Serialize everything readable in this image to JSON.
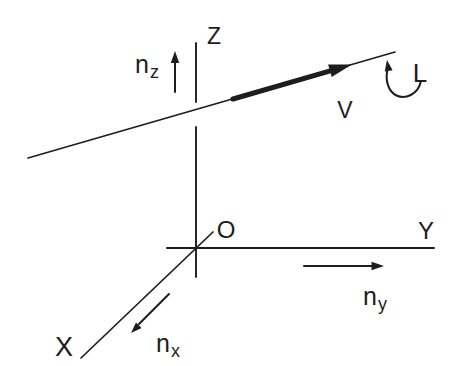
{
  "figure": {
    "colors": {
      "ink": "#1d1d1d",
      "background": "#ffffff"
    },
    "labels": {
      "z_axis": "Z",
      "y_axis": "Y",
      "x_axis": "X",
      "origin": "O",
      "line": "L",
      "vector": "V",
      "n_x": {
        "base": "n",
        "sub": "x"
      },
      "n_y": {
        "base": "n",
        "sub": "y"
      },
      "n_z": {
        "base": "n",
        "sub": "z"
      }
    }
  }
}
